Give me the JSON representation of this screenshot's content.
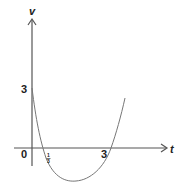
{
  "diagram": {
    "type": "velocity-time graph",
    "axes": {
      "vertical_label": "v",
      "horizontal_label": "t",
      "origin_label": "0"
    },
    "tick_labels": {
      "v_intercept": "3",
      "t_root_1_num": "1",
      "t_root_1_den": "3",
      "t_root_2": "3"
    },
    "curve": {
      "shape": "parabola opening upward",
      "v_intercept": 3,
      "roots": [
        "1/3",
        "3"
      ]
    },
    "colors": {
      "axis": "#555555",
      "curve": "#777777",
      "text": "#222222"
    }
  }
}
